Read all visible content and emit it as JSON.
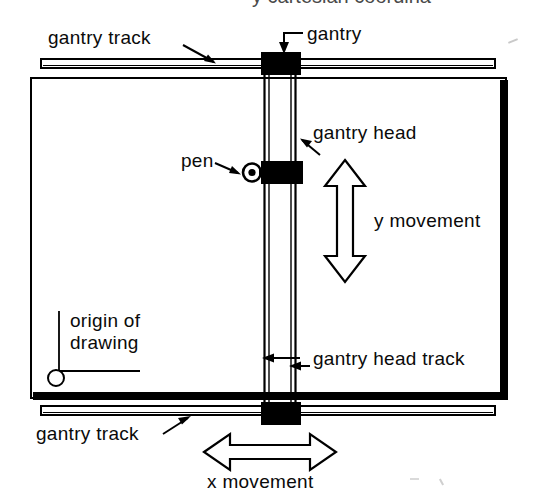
{
  "figure": {
    "title_clipped": "y cartesian coordina",
    "background_color": "#ffffff",
    "ink_color": "#000000",
    "width": 533,
    "height": 501
  },
  "labels": {
    "gantry_track_top": "gantry track",
    "gantry": "gantry",
    "gantry_head": "gantry head",
    "pen": "pen",
    "y_movement": "y movement",
    "origin_of_drawing_line1": "origin of",
    "origin_of_drawing_line2": "drawing",
    "gantry_head_track": "gantry head track",
    "gantry_track_bottom": "gantry track",
    "x_movement": "x movement"
  },
  "parts": {
    "gantry_block_top": "gantry-carriage-top",
    "gantry_block_bottom": "gantry-carriage-bottom",
    "gantry_head_block": "gantry-head-carriage",
    "pen_marker": "pen-tip",
    "origin_marker": "origin-circle",
    "bed": "drawing-bed",
    "rail_left": "gantry-head-rail-left",
    "rail_right": "gantry-head-rail-right",
    "track_top": "gantry-track-upper",
    "track_bottom": "gantry-track-lower"
  }
}
